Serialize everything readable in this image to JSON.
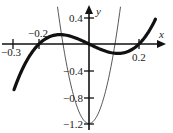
{
  "chart_data": {
    "type": "line",
    "title": "",
    "xlabel": "x",
    "ylabel": "y",
    "x_ticks": [
      {
        "value": -0.3,
        "label": "-0.3"
      },
      {
        "value": -0.2,
        "label": "-0.2"
      },
      {
        "value": 0.2,
        "label": "0.2"
      }
    ],
    "y_ticks": [
      {
        "value": 0.4,
        "label": "0.4"
      },
      {
        "value": -0.4,
        "label": "-0.4"
      },
      {
        "value": -0.8,
        "label": "-0.8"
      },
      {
        "value": -1.2,
        "label": "-1.2"
      }
    ],
    "xlim": [
      -0.34,
      0.34
    ],
    "ylim": [
      -1.25,
      0.5
    ],
    "grid": false,
    "series": [
      {
        "name": "cubic (thick)",
        "style": "thick",
        "x": [
          -0.3,
          -0.25,
          -0.2,
          -0.15,
          -0.1,
          -0.05,
          0,
          0.05,
          0.1,
          0.15,
          0.2,
          0.25,
          0.264
        ],
        "values": [
          -0.69,
          -0.26,
          0.0,
          0.12,
          0.14,
          0.09,
          0.0,
          -0.09,
          -0.14,
          -0.12,
          0.0,
          0.26,
          0.36
        ]
      },
      {
        "name": "parabola (thin)",
        "style": "thin",
        "x": [
          -0.126,
          -0.1,
          -0.05,
          0,
          0.05,
          0.1,
          0.126
        ],
        "values": [
          0.56,
          -0.09,
          -0.92,
          -1.2,
          -0.92,
          -0.09,
          0.56
        ]
      }
    ]
  },
  "labels": {
    "x_axis": "x",
    "y_axis": "y",
    "tick_m03": "−0.3",
    "tick_m02": "−0.2",
    "tick_p02": "0.2",
    "tick_p04": "0.4",
    "tick_m04": "−0.4",
    "tick_m08": "−0.8",
    "tick_m12": "−1.2"
  }
}
